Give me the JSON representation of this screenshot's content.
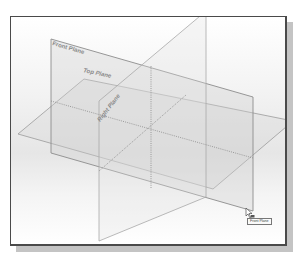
{
  "viewport": {
    "background_top": "#ffffff",
    "background_mid": "#e6e6e6",
    "frame_color": "#4a4a4a",
    "shadow_color": "#c4c4c4"
  },
  "planes": {
    "front": {
      "label": "Front Plane",
      "edge_color": "#8c8c8c"
    },
    "top": {
      "label": "Top Plane",
      "edge_color": "#9a9a9a"
    },
    "right": {
      "label": "Right Plane",
      "edge_color": "#a8a8a8"
    }
  },
  "cursor": {
    "icon": "select-arrow-with-plane-icon",
    "tooltip": "Front Plane"
  }
}
